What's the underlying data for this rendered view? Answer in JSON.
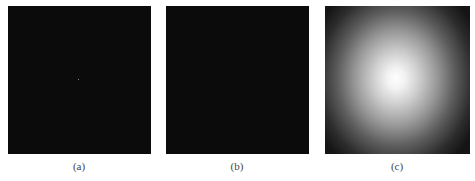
{
  "figure": {
    "panels": [
      {
        "id": "a",
        "caption": "(a)",
        "description": "near-black image with single faint bright point near center"
      },
      {
        "id": "b",
        "caption": "(b)",
        "description": "uniformly near-black image"
      },
      {
        "id": "c",
        "caption": "(c)",
        "description": "radial gradient, bright white center fading to dark corners"
      }
    ],
    "colors": {
      "background": "#ffffff",
      "dark_panel": "#0b0b0b",
      "gradient_center": "#ffffff",
      "gradient_edge": "#141414"
    }
  }
}
